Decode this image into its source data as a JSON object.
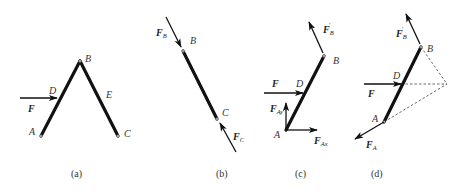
{
  "figure": {
    "panels": [
      {
        "id": "a",
        "caption": "(a)",
        "points": {
          "A": "A",
          "B": "B",
          "C": "C",
          "D": "D",
          "E": "E"
        },
        "forces": {
          "F": "F"
        },
        "description": "Three-hinged frame ABC with horizontal force F applied at D on member AB"
      },
      {
        "id": "b",
        "caption": "(b)",
        "points": {
          "B": "B",
          "C": "C"
        },
        "forces": {
          "FB": {
            "main": "F",
            "sub": "B"
          },
          "FC": {
            "main": "F",
            "sub": "C"
          }
        },
        "description": "Free-body of two-force member BC with compressive forces F_B and F_C"
      },
      {
        "id": "c",
        "caption": "(c)",
        "points": {
          "A": "A",
          "B": "B",
          "D": "D"
        },
        "forces": {
          "F": "F",
          "FBprime": {
            "main": "F",
            "sub": "B",
            "prime": "′"
          },
          "FAx": {
            "main": "F",
            "sub": "Ax"
          },
          "FAy": {
            "main": "F",
            "sub": "Ay"
          }
        },
        "description": "Free-body of member AB with reaction components F_Ax, F_Ay and F'_B"
      },
      {
        "id": "d",
        "caption": "(d)",
        "points": {
          "A": "A",
          "B": "B",
          "D": "D"
        },
        "forces": {
          "F": "F",
          "FBprime": {
            "main": "F",
            "sub": "B",
            "prime": "′"
          },
          "FA": {
            "main": "F",
            "sub": "A"
          }
        },
        "description": "Three-force member AB: lines of action of F, F'_B and F_A meet at one point (dashed)"
      }
    ]
  },
  "colors": {
    "ink": "#111111",
    "pin": "#999999",
    "background": "#ffffff"
  }
}
